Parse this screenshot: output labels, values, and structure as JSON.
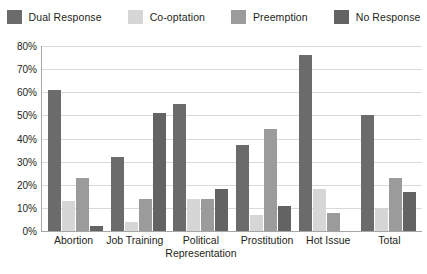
{
  "chart_data": {
    "type": "bar",
    "title": "",
    "xlabel": "",
    "ylabel": "",
    "ylim": [
      0,
      80
    ],
    "ytick_labels": [
      "0%",
      "10%",
      "20%",
      "30%",
      "40%",
      "50%",
      "60%",
      "70%",
      "80%"
    ],
    "ytick_values": [
      0,
      10,
      20,
      30,
      40,
      50,
      60,
      70,
      80
    ],
    "grid": "horizontal",
    "legend_position": "top",
    "categories": [
      "Abortion",
      "Job Training",
      "Political Representation",
      "Prostitution",
      "Hot Issue",
      "Total"
    ],
    "category_lines": [
      [
        "Abortion"
      ],
      [
        "Job Training"
      ],
      [
        "Political",
        "Representation"
      ],
      [
        "Prostitution"
      ],
      [
        "Hot Issue"
      ],
      [
        "Total"
      ]
    ],
    "series": [
      {
        "name": "Dual Response",
        "color": "#6b6b6b",
        "values": [
          61,
          32,
          55,
          37,
          76,
          50
        ]
      },
      {
        "name": "Co-optation",
        "color": "#d6d6d6",
        "values": [
          13,
          4,
          14,
          7,
          18,
          10
        ]
      },
      {
        "name": "Preemption",
        "color": "#9b9b9b",
        "values": [
          23,
          14,
          14,
          44,
          8,
          23
        ]
      },
      {
        "name": "No Response",
        "color": "#636363",
        "values": [
          2,
          51,
          18,
          11,
          0,
          17
        ]
      }
    ]
  }
}
